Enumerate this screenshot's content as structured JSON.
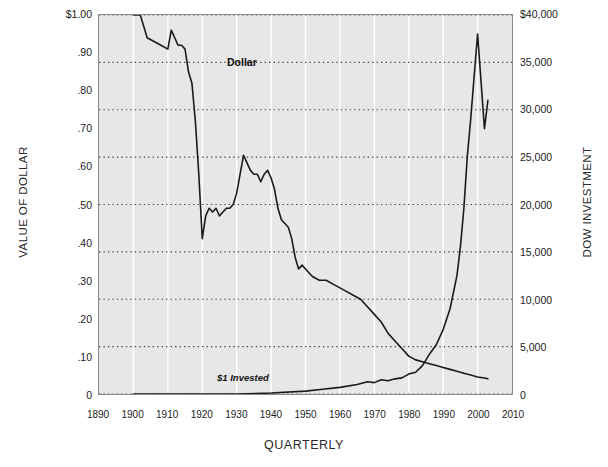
{
  "chart_data": {
    "type": "line",
    "title": "",
    "xlabel": "QUARTERLY",
    "ylabel": "VALUE OF DOLLAR",
    "y2label": "DOW INVESTMENT",
    "grid": true,
    "legend_position": "inline-labels",
    "xlim": [
      1890,
      2010
    ],
    "xticks": [
      1890,
      1900,
      1910,
      1920,
      1930,
      1940,
      1950,
      1960,
      1970,
      1980,
      1990,
      2000,
      2010
    ],
    "xtick_labels": [
      "1890",
      "1900",
      "1910",
      "1920",
      "1930",
      "1940",
      "1950",
      "1960",
      "1970",
      "1980",
      "1990",
      "2000",
      "2010"
    ],
    "ylim": [
      0,
      1.0
    ],
    "yticks": [
      0,
      0.1,
      0.2,
      0.3,
      0.4,
      0.5,
      0.6,
      0.7,
      0.8,
      0.9,
      1.0
    ],
    "ytick_labels": [
      "0",
      ".10",
      ".20",
      ".30",
      ".40",
      ".50",
      ".60",
      ".70",
      ".80",
      ".90",
      "$1.00"
    ],
    "y2lim": [
      0,
      40000
    ],
    "y2ticks": [
      0,
      5000,
      10000,
      15000,
      20000,
      25000,
      30000,
      35000,
      40000
    ],
    "y2tick_labels": [
      "0",
      "5,000",
      "10,000",
      "15,000",
      "20,000",
      "25,000",
      "30,000",
      "35,000",
      "$40,000"
    ],
    "gridline_values_y2": [
      5000,
      10000,
      15000,
      20000,
      25000,
      30000,
      35000,
      40000
    ],
    "annotations": [
      {
        "name": "dollar-series-label",
        "text": "Dollar",
        "x": 1903,
        "y": 1.02
      },
      {
        "name": "dow-series-label",
        "text": "Dow",
        "x": 2003,
        "y": 38500
      },
      {
        "name": "invested-note",
        "text": "$1 Invested",
        "x": 1897,
        "y": 600
      }
    ],
    "series": [
      {
        "name": "Dollar",
        "axis": "left",
        "color": "#1a1a1a",
        "x": [
          1900,
          1902,
          1904,
          1906,
          1908,
          1910,
          1911,
          1912,
          1913,
          1914,
          1915,
          1916,
          1917,
          1918,
          1919,
          1920,
          1921,
          1922,
          1923,
          1924,
          1925,
          1926,
          1927,
          1928,
          1929,
          1930,
          1931,
          1932,
          1933,
          1934,
          1935,
          1936,
          1937,
          1938,
          1939,
          1940,
          1941,
          1942,
          1943,
          1944,
          1945,
          1946,
          1947,
          1948,
          1949,
          1950,
          1952,
          1954,
          1956,
          1958,
          1960,
          1962,
          1964,
          1966,
          1968,
          1970,
          1972,
          1974,
          1976,
          1978,
          1980,
          1982,
          1984,
          1986,
          1988,
          1990,
          1992,
          1994,
          1996,
          1998,
          2000,
          2002,
          2003
        ],
        "y": [
          1.0,
          1.0,
          0.94,
          0.93,
          0.92,
          0.91,
          0.96,
          0.94,
          0.92,
          0.92,
          0.91,
          0.85,
          0.82,
          0.72,
          0.58,
          0.41,
          0.47,
          0.49,
          0.48,
          0.49,
          0.47,
          0.48,
          0.49,
          0.49,
          0.5,
          0.53,
          0.58,
          0.63,
          0.61,
          0.59,
          0.58,
          0.58,
          0.56,
          0.58,
          0.59,
          0.57,
          0.54,
          0.49,
          0.46,
          0.45,
          0.44,
          0.41,
          0.36,
          0.33,
          0.34,
          0.33,
          0.31,
          0.3,
          0.3,
          0.29,
          0.28,
          0.27,
          0.26,
          0.25,
          0.23,
          0.21,
          0.19,
          0.16,
          0.14,
          0.12,
          0.1,
          0.09,
          0.085,
          0.08,
          0.075,
          0.07,
          0.065,
          0.06,
          0.055,
          0.05,
          0.045,
          0.042,
          0.04
        ]
      },
      {
        "name": "Dow",
        "axis": "right",
        "color": "#1a1a1a",
        "x": [
          1900,
          1910,
          1920,
          1930,
          1940,
          1950,
          1955,
          1960,
          1965,
          1968,
          1970,
          1972,
          1974,
          1976,
          1978,
          1980,
          1982,
          1984,
          1986,
          1988,
          1990,
          1992,
          1994,
          1995,
          1996,
          1997,
          1998,
          1999,
          2000,
          2001,
          2002,
          2003
        ],
        "y": [
          0,
          0,
          0,
          0,
          100,
          300,
          500,
          700,
          1000,
          1300,
          1200,
          1500,
          1400,
          1600,
          1700,
          2100,
          2300,
          3000,
          4200,
          5200,
          6800,
          9000,
          12500,
          15500,
          19500,
          25000,
          29000,
          33500,
          38000,
          33000,
          28000,
          31000
        ]
      }
    ]
  },
  "labels": {
    "y_axis_title": "VALUE OF DOLLAR",
    "y2_axis_title": "DOW INVESTMENT",
    "x_axis_title": "QUARTERLY",
    "dollar_label": "Dollar",
    "dow_label": "Dow",
    "invested_label": "$1 Invested"
  },
  "colors": {
    "plot_background": "#e7e7e7",
    "page_background": "#ffffff",
    "line": "#1a1a1a",
    "grid_dotted": "#3a3a3a",
    "grid_vertical": "#ffffff",
    "frame": "#8a8a8a"
  }
}
